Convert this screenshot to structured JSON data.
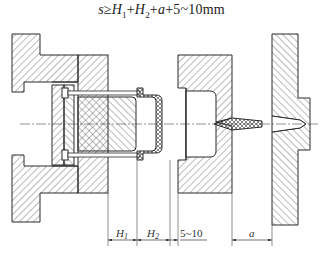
{
  "formula": {
    "lhs": "s",
    "relation": "≥",
    "terms": [
      "H",
      "1",
      "H",
      "2",
      "a"
    ],
    "tail": "+5~10mm",
    "full_text": "s≥H1+H2+a+5~10mm"
  },
  "dimensions": [
    {
      "label": "H",
      "sub": "1",
      "name": "H1"
    },
    {
      "label": "H",
      "sub": "2",
      "name": "H2"
    },
    {
      "label": "5~10",
      "sub": "",
      "name": "gap-5-10"
    },
    {
      "label": "a",
      "sub": "",
      "name": "a"
    }
  ],
  "colors": {
    "line": "#2a2a2a",
    "hatch": "#555555",
    "background": "#ffffff"
  }
}
